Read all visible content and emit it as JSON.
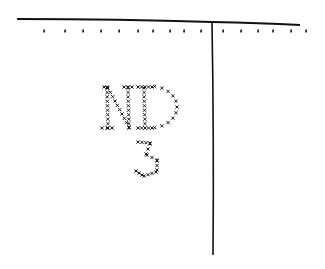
{
  "diagram": {
    "top_line": {
      "x1": 17,
      "y1": 19,
      "x2": 300,
      "y2": 25
    },
    "vertical_line": {
      "x1": 212,
      "y1": 22,
      "x2": 213,
      "y2": 255
    },
    "dot_row_y": 31,
    "dots_x": [
      44,
      65,
      83,
      101,
      119,
      138,
      153,
      170,
      184,
      201,
      223,
      241,
      258,
      273,
      291,
      306
    ],
    "stitched_text": {
      "line1": "ND",
      "line2": "3",
      "color": "#1a1a1a"
    },
    "stroke_color": "#111111"
  }
}
